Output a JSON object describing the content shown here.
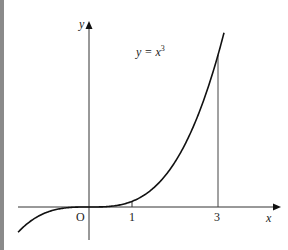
{
  "diagram": {
    "equation_label": "y = x",
    "equation_exponent": "3",
    "axis_x_label": "x",
    "axis_y_label": "y",
    "origin_label": "O",
    "tick_labels": [
      "1",
      "3"
    ]
  },
  "chart_data": {
    "type": "line",
    "xlabel": "x",
    "ylabel": "y",
    "function": "y = x^3",
    "x_ticks": [
      1,
      3
    ],
    "marked_vertical_line_at_x": 3,
    "xlim": [
      -1.65,
      4.3
    ],
    "ylim": [
      -6,
      33
    ],
    "grid": false,
    "series": [
      {
        "name": "y = x^3",
        "x": [
          -1.65,
          -1,
          -0.5,
          0,
          0.5,
          1,
          1.5,
          2,
          2.5,
          3,
          3.14
        ],
        "y": [
          -4.49,
          -1,
          -0.125,
          0,
          0.125,
          1,
          3.375,
          8,
          15.625,
          27,
          30.96
        ]
      }
    ]
  }
}
